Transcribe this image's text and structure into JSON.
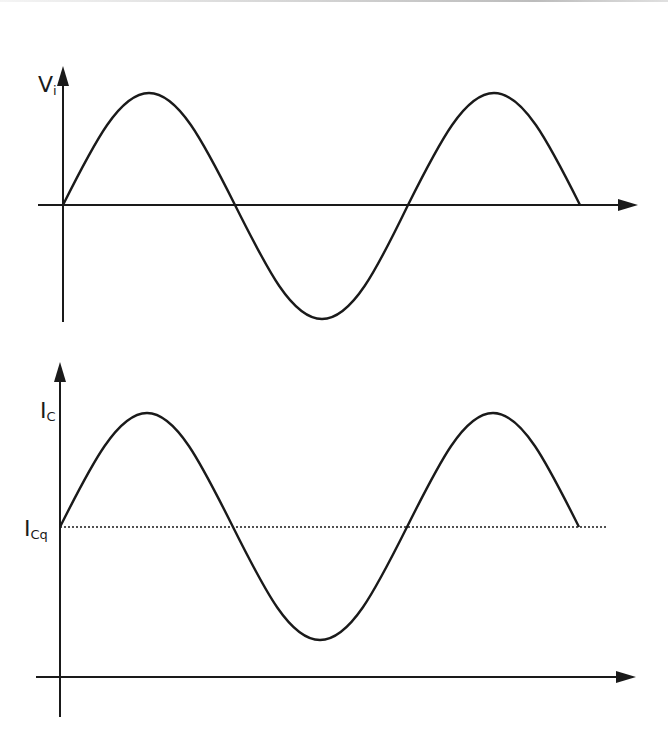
{
  "diagram": {
    "top_plot": {
      "y_label": "V",
      "y_label_sub": "i",
      "baseline": "0"
    },
    "bottom_plot": {
      "y_label": "I",
      "y_label_sub": "C",
      "baseline_label": "I",
      "baseline_label_sub": "Cq"
    },
    "colors": {
      "stroke": "#1a1a1a",
      "background": "#ffffff"
    }
  }
}
